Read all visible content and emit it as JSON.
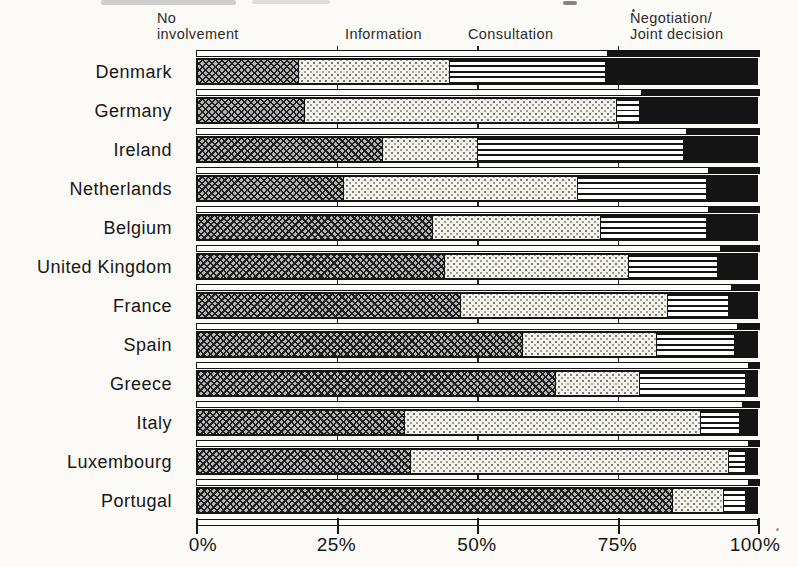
{
  "chart_data": {
    "type": "bar",
    "stacked": true,
    "orientation": "horizontal",
    "unit": "%",
    "categories": [
      "Denmark",
      "Germany",
      "Ireland",
      "Netherlands",
      "Belgium",
      "United Kingdom",
      "France",
      "Spain",
      "Greece",
      "Italy",
      "Luxembourg",
      "Portugal"
    ],
    "series": [
      {
        "name": "No involvement",
        "pattern": "dark-crosshatch",
        "values": [
          18,
          19,
          33,
          26,
          42,
          44,
          47,
          58,
          64,
          37,
          38,
          85
        ]
      },
      {
        "name": "Information",
        "pattern": "light-stipple",
        "values": [
          27,
          56,
          17,
          42,
          30,
          33,
          37,
          24,
          15,
          53,
          57,
          9
        ]
      },
      {
        "name": "Consultation",
        "pattern": "horizontal-lines",
        "values": [
          28,
          4,
          37,
          23,
          19,
          16,
          11,
          14,
          19,
          7,
          3,
          4
        ]
      },
      {
        "name": "Negotiation/Joint decision",
        "pattern": "solid-black",
        "values": [
          27,
          21,
          13,
          9,
          9,
          7,
          5,
          4,
          2,
          3,
          2,
          2
        ]
      }
    ],
    "x_ticks": [
      {
        "label": "0%",
        "value": 0
      },
      {
        "label": "25%",
        "value": 25
      },
      {
        "label": "50%",
        "value": 50
      },
      {
        "label": "75%",
        "value": 75
      },
      {
        "label": "100%",
        "value": 100
      }
    ],
    "xlim": [
      0,
      100
    ],
    "legend_position": "top",
    "grid": "tick stubs at 25/50/75 between bars"
  },
  "legend": {
    "items": [
      {
        "lines": [
          "No",
          "involvement"
        ],
        "pattern": "dark-crosshatch"
      },
      {
        "lines": [
          "Information"
        ],
        "pattern": "light-stipple"
      },
      {
        "lines": [
          "Consultation"
        ],
        "pattern": "horizontal-lines"
      },
      {
        "lines": [
          "Negotiation/",
          "Joint decision"
        ],
        "pattern": "solid-black"
      }
    ]
  },
  "colors": {
    "ink": "#141414",
    "paper": "#fbfaf6",
    "stipple_bg": "#f4f3ec",
    "crosshatch_bg": "#b4b4b4",
    "solid_segment": "#141414"
  }
}
